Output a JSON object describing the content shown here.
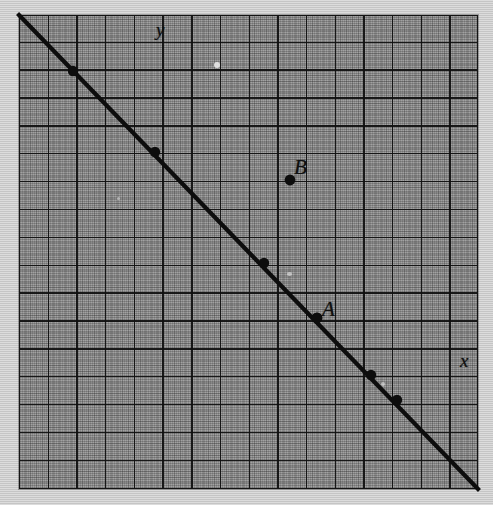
{
  "figure": {
    "kind": "coordinate-grid-line-graph",
    "background_color": "#8d8d8d",
    "grid_line_color": "#141414",
    "line_color": "#0d0d0d",
    "labels": {
      "y_axis": "y",
      "x_axis": "x",
      "point_a": "A",
      "point_b": "B"
    }
  },
  "chart_data": {
    "type": "line",
    "title": "",
    "xlabel": "x",
    "ylabel": "y",
    "grid": true,
    "legend": false,
    "axis_note": "Unlabeled square grid; 16 columns by 17 rows of major cells",
    "grid_cells": {
      "columns": 16,
      "rows": 17
    },
    "series": [
      {
        "name": "line",
        "slope": -1,
        "description": "Straight line descending from upper-left to lower-right with slope -1",
        "endpoints_px": [
          [
            19,
            15
          ],
          [
            478,
            489
          ]
        ],
        "marked_points_px": [
          [
            73,
            71
          ],
          [
            155,
            152
          ],
          [
            264,
            263
          ],
          [
            317,
            318
          ],
          [
            371,
            375
          ],
          [
            397,
            400
          ]
        ]
      }
    ],
    "points": [
      {
        "label": "A",
        "on_line": true,
        "x_px": 317,
        "y_px": 318
      },
      {
        "label": "B",
        "on_line": false,
        "x_px": 290,
        "y_px": 180
      }
    ],
    "annotations": [
      {
        "text": "y",
        "x_px": 162,
        "y_px": 30
      },
      {
        "text": "x",
        "x_px": 466,
        "y_px": 361
      },
      {
        "text": "A",
        "x_px": 330,
        "y_px": 310
      },
      {
        "text": "B",
        "x_px": 302,
        "y_px": 168
      }
    ]
  }
}
